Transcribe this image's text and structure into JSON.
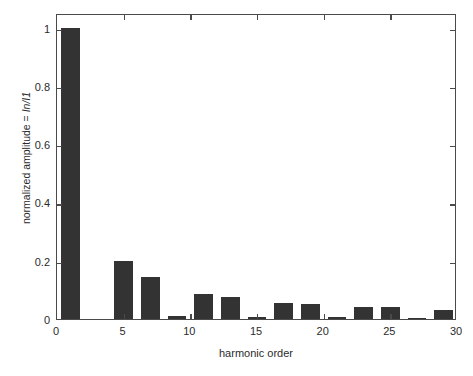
{
  "chart_data": {
    "type": "bar",
    "title": "",
    "subtitle": "",
    "xlabel": "harmonic order",
    "ylabel": "normalized amplitude = In/I1",
    "ylabel_prefix": "normalized amplitude = ",
    "ylabel_italic": "In/I1",
    "xlim": [
      0,
      30
    ],
    "ylim": [
      0,
      1.05
    ],
    "xticks": [
      0,
      5,
      10,
      15,
      20,
      25,
      30
    ],
    "xtick_labels": [
      "0",
      "5",
      "10",
      "15",
      "20",
      "25",
      "30"
    ],
    "yticks": [
      0,
      0.2,
      0.4,
      0.6,
      0.8,
      1
    ],
    "ytick_labels": [
      "0",
      "0.2",
      "0.4",
      "0.6",
      "0.8",
      "1"
    ],
    "grid": false,
    "legend": null,
    "bar_color": "#333333",
    "axis_color": "#4a4a4a",
    "background": "#ffffff",
    "bar_width": 1.4,
    "categories": [
      1,
      5,
      7,
      9,
      11,
      13,
      15,
      17,
      19,
      21,
      23,
      25,
      27,
      29
    ],
    "values": [
      1.0,
      0.2,
      0.145,
      0.009,
      0.085,
      0.075,
      0.007,
      0.055,
      0.052,
      0.006,
      0.042,
      0.04,
      0.005,
      0.032
    ],
    "series": [
      {
        "name": "normalized harmonic amplitude",
        "points": [
          {
            "x": 1,
            "y": 1.0
          },
          {
            "x": 5,
            "y": 0.2
          },
          {
            "x": 7,
            "y": 0.145
          },
          {
            "x": 9,
            "y": 0.009
          },
          {
            "x": 11,
            "y": 0.085
          },
          {
            "x": 13,
            "y": 0.075
          },
          {
            "x": 15,
            "y": 0.007
          },
          {
            "x": 17,
            "y": 0.055
          },
          {
            "x": 19,
            "y": 0.052
          },
          {
            "x": 21,
            "y": 0.006
          },
          {
            "x": 23,
            "y": 0.042
          },
          {
            "x": 25,
            "y": 0.04
          },
          {
            "x": 27,
            "y": 0.005
          },
          {
            "x": 29,
            "y": 0.032
          }
        ]
      }
    ]
  }
}
